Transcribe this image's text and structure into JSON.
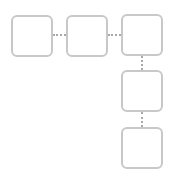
{
  "diagram": {
    "type": "flow",
    "nodes": [
      {
        "id": "node-1",
        "label": ""
      },
      {
        "id": "node-2",
        "label": ""
      },
      {
        "id": "node-3",
        "label": ""
      },
      {
        "id": "node-4",
        "label": ""
      },
      {
        "id": "node-5",
        "label": ""
      }
    ],
    "edges": [
      {
        "from": "node-1",
        "to": "node-2",
        "style": "dotted"
      },
      {
        "from": "node-2",
        "to": "node-3",
        "style": "dotted"
      },
      {
        "from": "node-3",
        "to": "node-4",
        "style": "dotted"
      },
      {
        "from": "node-4",
        "to": "node-5",
        "style": "dotted"
      }
    ],
    "colors": {
      "node_border": "#c8c8c8",
      "edge": "#a8a8a8",
      "background": "#ffffff"
    }
  }
}
